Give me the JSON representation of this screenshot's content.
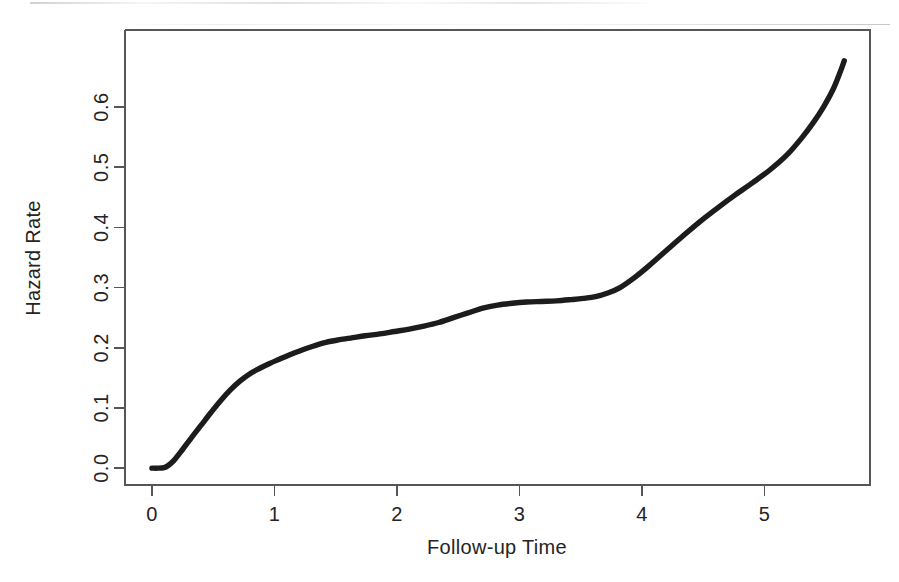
{
  "chart_data": {
    "type": "line",
    "title": "",
    "subtitle": "",
    "xlabel": "Follow-up Time",
    "ylabel": "Hazard Rate",
    "xlim": [
      -0.22,
      5.86
    ],
    "ylim": [
      -0.028,
      0.728
    ],
    "xticks": [
      0,
      1,
      2,
      3,
      4,
      5
    ],
    "xticklabels": [
      "0",
      "1",
      "2",
      "3",
      "4",
      "5"
    ],
    "yticks": [
      0.0,
      0.1,
      0.2,
      0.3,
      0.4,
      0.5,
      0.6
    ],
    "yticklabels": [
      "0.0",
      "0.1",
      "0.2",
      "0.3",
      "0.4",
      "0.5",
      "0.6"
    ],
    "grid": false,
    "legend": null,
    "legend_position": "none",
    "box": true,
    "series": [
      {
        "name": "Cumulative hazard",
        "color": "#1c1c1c",
        "linewidth": 5.4,
        "x": [
          0.0,
          0.05,
          0.1,
          0.13,
          0.18,
          0.25,
          0.32,
          0.4,
          0.48,
          0.56,
          0.64,
          0.72,
          0.8,
          0.88,
          0.96,
          1.04,
          1.12,
          1.22,
          1.32,
          1.42,
          1.52,
          1.62,
          1.74,
          1.86,
          1.98,
          2.1,
          2.22,
          2.34,
          2.46,
          2.58,
          2.7,
          2.82,
          2.94,
          3.06,
          3.18,
          3.3,
          3.42,
          3.52,
          3.62,
          3.72,
          3.82,
          3.94,
          4.06,
          4.2,
          4.34,
          4.48,
          4.62,
          4.76,
          4.9,
          5.04,
          5.18,
          5.3,
          5.4,
          5.48,
          5.56,
          5.62,
          5.65
        ],
        "y": [
          0.0,
          0.0,
          0.001,
          0.004,
          0.013,
          0.031,
          0.05,
          0.071,
          0.092,
          0.112,
          0.13,
          0.145,
          0.157,
          0.166,
          0.174,
          0.181,
          0.188,
          0.196,
          0.203,
          0.209,
          0.213,
          0.216,
          0.22,
          0.223,
          0.227,
          0.231,
          0.236,
          0.242,
          0.25,
          0.258,
          0.266,
          0.271,
          0.274,
          0.276,
          0.277,
          0.278,
          0.28,
          0.282,
          0.285,
          0.291,
          0.3,
          0.317,
          0.337,
          0.362,
          0.387,
          0.411,
          0.433,
          0.454,
          0.474,
          0.495,
          0.52,
          0.548,
          0.575,
          0.6,
          0.63,
          0.66,
          0.677
        ]
      }
    ],
    "annotations": []
  },
  "axes": {
    "x_label": "Follow-up Time",
    "y_label": "Hazard Rate",
    "x_tick_labels": [
      "0",
      "1",
      "2",
      "3",
      "4",
      "5"
    ],
    "y_tick_labels": [
      "0.0",
      "0.1",
      "0.2",
      "0.3",
      "0.4",
      "0.5",
      "0.6"
    ]
  },
  "style": {
    "background_color": "#ffffff",
    "line_color": "#1c1c1c",
    "axis_color": "#55565a",
    "text_color": "#242424"
  }
}
